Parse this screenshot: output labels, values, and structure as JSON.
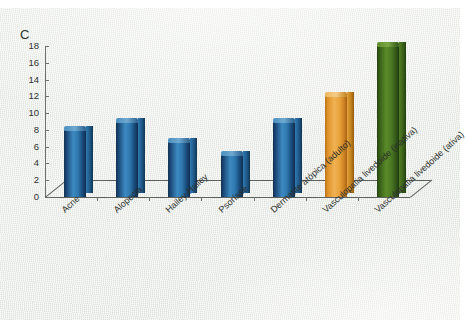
{
  "panel": {
    "label": "C"
  },
  "colors": {
    "blue": "#2d77ad",
    "orange": "#e8a23a",
    "green": "#4a7822",
    "paper": "#e7eae5",
    "axis": "#5d625d",
    "text": "#2b2e2b"
  },
  "axis": {
    "y_ticks": [
      "18",
      "16",
      "14",
      "12",
      "10",
      "8",
      "6",
      "4",
      "2",
      "0"
    ],
    "y_min": 0,
    "y_max": 18,
    "y_step": 2
  },
  "categories": [
    "Acne",
    "Alopecia",
    "Hailey-Hailey",
    "Psoríase",
    "Dermatite atópica (adulto)",
    "Vasculopatia livedoide (inativa)",
    "Vasculopatia livedoide (ativa)"
  ],
  "chart_data": {
    "type": "bar",
    "title": "C",
    "subtitle": "",
    "xlabel": "",
    "ylabel": "",
    "ylim": [
      0,
      18
    ],
    "ytick_step": 2,
    "grid": false,
    "legend": "none",
    "three_d": true,
    "categories": [
      "Acne",
      "Alopecia",
      "Hailey-Hailey",
      "Psoríase",
      "Dermatite atópica (adulto)",
      "Vasculopatia livedoide (inativa)",
      "Vasculopatia livedoide (ativa)"
    ],
    "values": [
      8,
      9,
      6.5,
      5,
      9,
      12,
      18
    ],
    "bar_colors": [
      "#2d77ad",
      "#2d77ad",
      "#2d77ad",
      "#2d77ad",
      "#2d77ad",
      "#e8a23a",
      "#4a7822"
    ],
    "tick_labels": [
      "0",
      "2",
      "4",
      "6",
      "8",
      "10",
      "12",
      "14",
      "16",
      "18"
    ]
  }
}
